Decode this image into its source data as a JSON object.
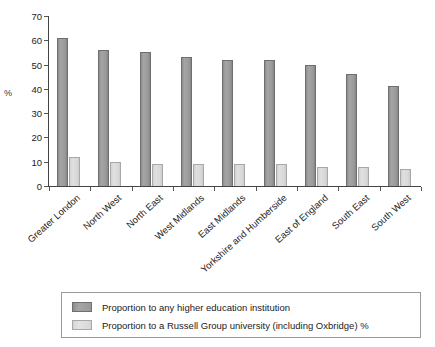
{
  "chart_data": {
    "type": "bar",
    "title": "",
    "xlabel": "",
    "ylabel": "%",
    "ylim": [
      0,
      70
    ],
    "ytick_step": 10,
    "yticks": [
      70,
      60,
      50,
      40,
      30,
      20,
      10,
      0
    ],
    "grid": false,
    "legend_position": "bottom",
    "categories": [
      "Greater London",
      "North West",
      "North East",
      "West Midlands",
      "East Midlands",
      "Yorkshire and Humberside",
      "East of England",
      "South East",
      "South West"
    ],
    "series": [
      {
        "name": "Proportion to any higher education institution",
        "color": "#9b9b9b",
        "values": [
          61,
          56,
          55,
          53,
          52,
          52,
          50,
          46,
          41
        ]
      },
      {
        "name": "Proportion to a Russell Group university (including Oxbridge) %",
        "color": "#d9d9d9",
        "values": [
          12,
          10,
          9,
          9,
          9,
          9,
          8,
          8,
          7
        ]
      }
    ]
  },
  "legend": {
    "items": [
      {
        "label": "Proportion to any higher education institution"
      },
      {
        "label": "Proportion to a Russell Group university (including Oxbridge) %"
      }
    ]
  }
}
